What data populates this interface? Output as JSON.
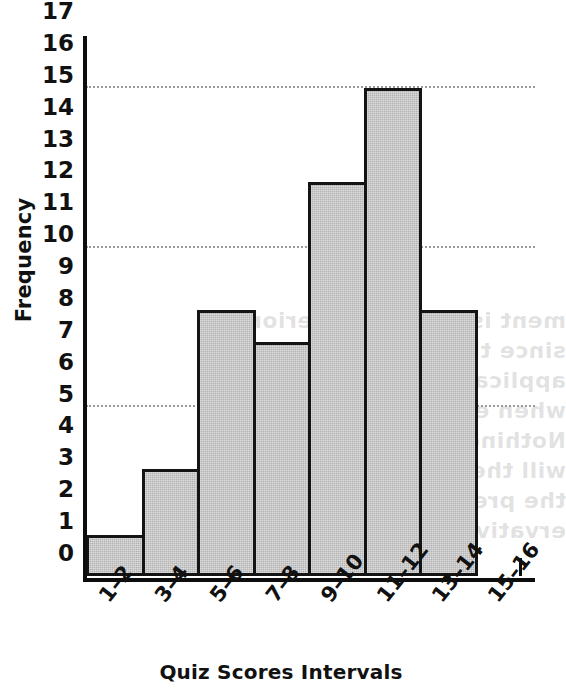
{
  "chart_data": {
    "type": "bar",
    "title": "",
    "subtitle": "",
    "xlabel": "Quiz Scores Intervals",
    "ylabel": "Frequency",
    "categories": [
      "1–2",
      "3–4",
      "5–6",
      "7–8",
      "9–10",
      "11–12",
      "13–14",
      "15–16"
    ],
    "values": [
      1.3,
      3.35,
      8.35,
      7.35,
      12.35,
      15.3,
      8.35,
      0
    ],
    "ylim": [
      0,
      17
    ],
    "yticks": [
      0,
      1,
      2,
      3,
      4,
      5,
      6,
      7,
      8,
      9,
      10,
      11,
      12,
      13,
      14,
      15,
      16,
      17
    ],
    "ytick_labels": [
      "0",
      "1",
      "2",
      "3",
      "4",
      "5",
      "6",
      "7",
      "8",
      "9",
      "10",
      "11",
      "12",
      "13",
      "14",
      "15",
      "16",
      "17"
    ],
    "gridlines": [
      5.3,
      10.3,
      15.3
    ],
    "grid": "horizontal-dotted",
    "legend": "none",
    "bar_fill_color": "#b3b3b3",
    "bar_edge_color": "#141414",
    "axis_color": "#0d0d0d",
    "gridline_color": "#9a9a9a",
    "background_color": "#ffffff"
  },
  "artifacts": {
    "bleed_text": "ment is de ed to interior since the size of the p applicant s to pro ide me when ed to use a Nothing in this course or will the ons situation is the pressure obs ervative"
  }
}
